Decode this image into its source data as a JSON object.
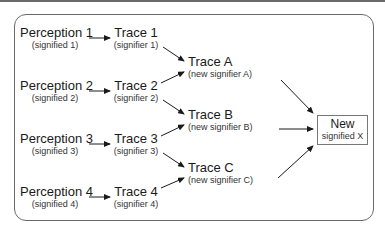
{
  "diagram": {
    "perceptions": [
      {
        "label": "Perception 1",
        "sub": "(signified 1)"
      },
      {
        "label": "Perception 2",
        "sub": "(signified 2)"
      },
      {
        "label": "Perception 3",
        "sub": "(signified 3)"
      },
      {
        "label": "Perception 4",
        "sub": "(signified 4)"
      }
    ],
    "traces": [
      {
        "label": "Trace 1",
        "sub": "(signifier 1)"
      },
      {
        "label": "Trace 2",
        "sub": "(signifier 2)"
      },
      {
        "label": "Trace 3",
        "sub": "(signifier 3)"
      },
      {
        "label": "Trace 4",
        "sub": "(signifier 4)"
      }
    ],
    "combined_traces": [
      {
        "label": "Trace A",
        "sub": "(new signifier A)"
      },
      {
        "label": "Trace B",
        "sub": "(new signifier B)"
      },
      {
        "label": "Trace C",
        "sub": "(new signifier C)"
      }
    ],
    "result": {
      "label": "New",
      "sub": "signified X"
    },
    "edges": [
      [
        "Perception 1",
        "Trace 1"
      ],
      [
        "Perception 2",
        "Trace 2"
      ],
      [
        "Perception 3",
        "Trace 3"
      ],
      [
        "Perception 4",
        "Trace 4"
      ],
      [
        "Trace 1",
        "Trace A"
      ],
      [
        "Trace 2",
        "Trace A"
      ],
      [
        "Trace 2",
        "Trace B"
      ],
      [
        "Trace 3",
        "Trace B"
      ],
      [
        "Trace 3",
        "Trace C"
      ],
      [
        "Trace 4",
        "Trace C"
      ],
      [
        "Trace A",
        "New signified X"
      ],
      [
        "Trace B",
        "New signified X"
      ],
      [
        "Trace C",
        "New signified X"
      ]
    ],
    "colors": {
      "line": "#1a1a1a",
      "frame": "#6a6a6a",
      "text": "#1a1a1a"
    }
  }
}
